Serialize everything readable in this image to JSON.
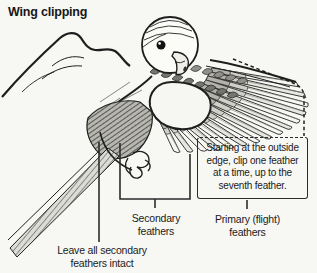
{
  "title": "Wing clipping",
  "callout": {
    "text": "Starting at the outside\nedge, clip one feather\nat a time, up to the\nseventh feather."
  },
  "labels": {
    "secondary_feathers": "Secondary\nfeathers",
    "primary_feathers": "Primary (flight)\nfeathers",
    "leave_secondary": "Leave all secondary\nfeathers intact"
  },
  "icons": {
    "illustration": "hand-holding-budgie-with-spread-wing-icon",
    "clip_guide": "dashed-clip-boundary"
  },
  "colors": {
    "ink": "#1e1e1e",
    "background": "#f7f7f4",
    "text": "#1b1b1b"
  }
}
